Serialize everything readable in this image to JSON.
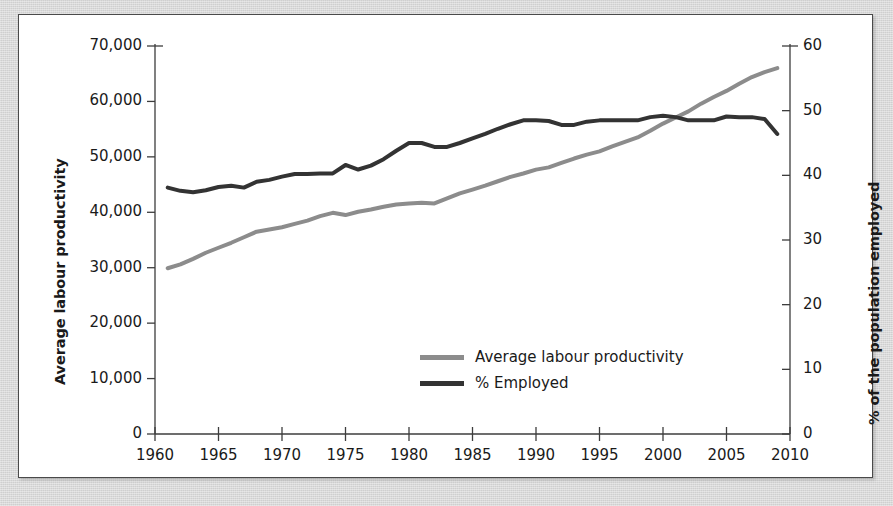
{
  "figure": {
    "background_color": "#d6d6d6",
    "plot_background_color": "#ffffff",
    "frame_color": "#4a4a4a"
  },
  "chart_data": {
    "type": "line",
    "title": "",
    "subtitle": "",
    "xlabel": "",
    "ylabel": "Average labour productivity",
    "ylabel_secondary": "% of the population employed",
    "grid": false,
    "legend_position": "inside-bottom-center",
    "xlim": [
      1960,
      2010
    ],
    "xticks": [
      1960,
      1965,
      1970,
      1975,
      1980,
      1985,
      1990,
      1995,
      2000,
      2005,
      2010
    ],
    "xtick_labels": [
      "1960",
      "1965",
      "1970",
      "1975",
      "1980",
      "1985",
      "1990",
      "1995",
      "2000",
      "2005",
      "2010"
    ],
    "ylim": [
      0,
      70000
    ],
    "yticks": [
      0,
      10000,
      20000,
      30000,
      40000,
      50000,
      60000,
      70000
    ],
    "ytick_labels": [
      "0",
      "10,000",
      "20,000",
      "30,000",
      "40,000",
      "50,000",
      "60,000",
      "70,000"
    ],
    "ylim_secondary": [
      0,
      60
    ],
    "yticks_secondary": [
      0,
      10,
      20,
      30,
      40,
      50,
      60
    ],
    "ytick_labels_secondary": [
      "0",
      "10",
      "20",
      "30",
      "40",
      "50",
      "60"
    ],
    "x": [
      1961,
      1962,
      1963,
      1964,
      1965,
      1966,
      1967,
      1968,
      1969,
      1970,
      1971,
      1972,
      1973,
      1974,
      1975,
      1976,
      1977,
      1978,
      1979,
      1980,
      1981,
      1982,
      1983,
      1984,
      1985,
      1986,
      1987,
      1988,
      1989,
      1990,
      1991,
      1992,
      1993,
      1994,
      1995,
      1996,
      1997,
      1998,
      1999,
      2000,
      2001,
      2002,
      2003,
      2004,
      2005,
      2006,
      2007,
      2008,
      2009
    ],
    "series": [
      {
        "name": "Average labour productivity",
        "axis": "left",
        "color": "#8c8c8c",
        "line_width": 4,
        "values": [
          29900,
          30600,
          31600,
          32700,
          33600,
          34500,
          35500,
          36500,
          36900,
          37300,
          37900,
          38500,
          39300,
          39900,
          39500,
          40100,
          40500,
          41000,
          41400,
          41600,
          41700,
          41600,
          42500,
          43400,
          44100,
          44800,
          45600,
          46400,
          47000,
          47700,
          48100,
          48900,
          49700,
          50400,
          51000,
          51900,
          52700,
          53500,
          54700,
          56000,
          57100,
          58200,
          59600,
          60800,
          61900,
          63200,
          64400,
          65300,
          66000
        ]
      },
      {
        "name": "% Employed",
        "axis": "right",
        "color": "#333333",
        "line_width": 4,
        "values": [
          38.1,
          37.6,
          37.4,
          37.7,
          38.2,
          38.4,
          38.1,
          39.0,
          39.3,
          39.8,
          40.2,
          40.2,
          40.3,
          40.3,
          41.6,
          40.9,
          41.5,
          42.5,
          43.8,
          45.0,
          45.0,
          44.4,
          44.4,
          45.0,
          45.7,
          46.4,
          47.2,
          47.9,
          48.5,
          48.5,
          48.4,
          47.8,
          47.8,
          48.3,
          48.5,
          48.5,
          48.5,
          48.5,
          49.0,
          49.2,
          49.0,
          48.5,
          48.5,
          48.5,
          49.1,
          49.0,
          49.0,
          48.7,
          46.4
        ]
      }
    ]
  },
  "legend": {
    "items": [
      {
        "label": "Average labour productivity",
        "color": "#8c8c8c"
      },
      {
        "label": "% Employed",
        "color": "#333333"
      }
    ]
  }
}
